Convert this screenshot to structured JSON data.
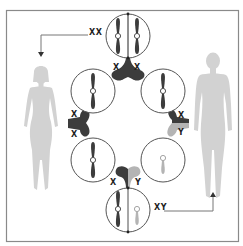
{
  "diagram": {
    "type": "sex-determination-chromosome-inheritance",
    "colors": {
      "frame": "#8a8a8a",
      "chromosome_x": "#3c3c3c",
      "chromosome_y": "#b4b4b4",
      "figure": "#cfcfcf",
      "circle_stroke": "#555555",
      "label": "#1e1e1e"
    },
    "labels": {
      "female_karyotype": "XX",
      "male_karyotype": "XY",
      "top_junction_left": "X",
      "top_junction_right": "X",
      "left_junction_top": "X",
      "left_junction_bottom": "X",
      "right_junction_top": "X",
      "right_junction_bottom": "Y",
      "bottom_junction_left": "X",
      "bottom_junction_right": "Y"
    },
    "nodes": [
      {
        "id": "female-cell",
        "position": "top",
        "chromosomes": [
          "X",
          "X"
        ]
      },
      {
        "id": "egg-upper",
        "position": "upper-left",
        "chromosomes": [
          "X"
        ]
      },
      {
        "id": "sperm-x",
        "position": "upper-right",
        "chromosomes": [
          "X"
        ]
      },
      {
        "id": "egg-lower",
        "position": "lower-left",
        "chromosomes": [
          "X"
        ]
      },
      {
        "id": "sperm-y",
        "position": "lower-right",
        "chromosomes": [
          "Y"
        ]
      },
      {
        "id": "male-cell",
        "position": "bottom",
        "chromosomes": [
          "X",
          "Y"
        ]
      }
    ],
    "figures": [
      {
        "id": "female-figure",
        "side": "left",
        "arrow_from": "female-cell",
        "arrow_label": "XX"
      },
      {
        "id": "male-figure",
        "side": "right",
        "arrow_from": "male-cell",
        "arrow_label": "XY"
      }
    ]
  }
}
